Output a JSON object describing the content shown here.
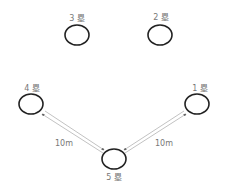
{
  "diagram": {
    "bases": [
      {
        "id": "base-3",
        "label": "3 塁"
      },
      {
        "id": "base-2",
        "label": "2 塁"
      },
      {
        "id": "base-4",
        "label": "4 塁"
      },
      {
        "id": "base-1",
        "label": "1 塁"
      },
      {
        "id": "base-5",
        "label": "5 塁"
      }
    ],
    "connections": [
      {
        "from": "base-4",
        "to": "base-5",
        "label": "10m",
        "bidirectional": true
      },
      {
        "from": "base-5",
        "to": "base-1",
        "label": "10m",
        "bidirectional": true
      }
    ],
    "colors": {
      "circle_stroke": "#222222",
      "label_text": "#777777",
      "arrow_line": "#999999"
    }
  }
}
